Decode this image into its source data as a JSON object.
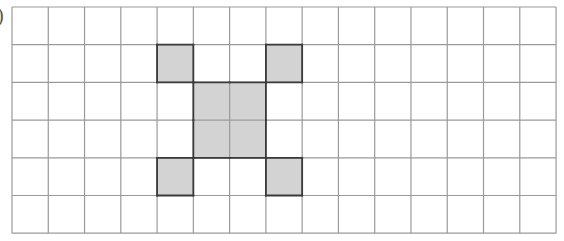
{
  "label": ")",
  "grid": {
    "cols": 15,
    "rows": 6,
    "origin_x": 12,
    "origin_y": 7,
    "cell_w": 36.27,
    "cell_h": 37.7,
    "line_color": "#9a9a9a",
    "shade_color": "#d3d3d3",
    "outline_color": "#3a3a3a"
  },
  "shapes": [
    {
      "name": "top-left-square",
      "cells": [
        [
          1,
          4
        ]
      ]
    },
    {
      "name": "top-right-square",
      "cells": [
        [
          1,
          7
        ]
      ]
    },
    {
      "name": "center-block",
      "cells": [
        [
          2,
          5
        ],
        [
          2,
          6
        ],
        [
          3,
          5
        ],
        [
          3,
          6
        ]
      ]
    },
    {
      "name": "bottom-left-square",
      "cells": [
        [
          4,
          4
        ]
      ]
    },
    {
      "name": "bottom-right-square",
      "cells": [
        [
          4,
          7
        ]
      ]
    }
  ]
}
